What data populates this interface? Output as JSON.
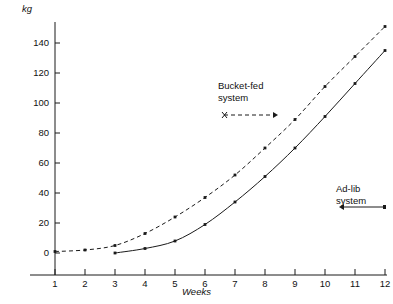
{
  "chart_data": {
    "type": "line",
    "title": "",
    "xlabel": "Weeks",
    "ylabel": "kg",
    "x": [
      1,
      2,
      3,
      4,
      5,
      6,
      7,
      8,
      9,
      10,
      11,
      12
    ],
    "xlim": [
      0.4,
      12.6
    ],
    "ylim": [
      -12,
      158
    ],
    "ytick_labels": [
      "0",
      "20",
      "40",
      "60",
      "80",
      "100",
      "120",
      "140"
    ],
    "ytick_values": [
      0,
      20,
      40,
      60,
      80,
      100,
      120,
      140
    ],
    "xtick_labels": [
      "1",
      "2",
      "3",
      "4",
      "5",
      "6",
      "7",
      "8",
      "9",
      "10",
      "11",
      "12"
    ],
    "grid": false,
    "legend_position": "inline-annotations",
    "series": [
      {
        "name": "Bucket-fed system",
        "style": "dashed",
        "marker": "dot",
        "x": [
          1,
          2,
          3,
          4,
          5,
          6,
          7,
          8,
          9,
          10,
          11,
          12
        ],
        "values": [
          1,
          2,
          5,
          13,
          24,
          37,
          52,
          70,
          89,
          111,
          131,
          151
        ]
      },
      {
        "name": "Ad-lib system",
        "style": "solid",
        "marker": "dot",
        "x": [
          3,
          4,
          5,
          6,
          7,
          8,
          9,
          10,
          11,
          12
        ],
        "values": [
          0,
          3,
          8,
          19,
          34,
          51,
          70,
          91,
          113,
          135
        ]
      }
    ],
    "annotations": [
      {
        "id": "bucket-fed",
        "line1": "Bucket-fed",
        "line2": "system",
        "pointer_style": "dashed",
        "pointer_direction": "right"
      },
      {
        "id": "ad-lib",
        "line1": "Ad-lib",
        "line2": "system",
        "pointer_style": "solid",
        "pointer_direction": "left"
      }
    ],
    "colors": {
      "axis": "#1a1a1a",
      "bucket_fed": "#1a1a1a",
      "ad_lib": "#1a1a1a",
      "background": "#ffffff"
    }
  }
}
